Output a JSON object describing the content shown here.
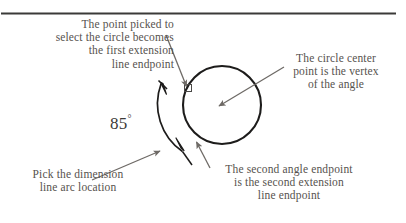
{
  "figure": {
    "type": "technical-illustration",
    "divider": {
      "present": true,
      "color": "#3b3a38"
    },
    "background_color": "#ffffff",
    "callouts": {
      "top_left": "The point picked to\nselect the circle becomes\nthe first extension\nline endpoint",
      "top_right": "The circle center\npoint is the vertex\nof the angle",
      "bottom_left": "Pick the dimension\nline arc location",
      "bottom_right": "The second angle endpoint\nis the second extension\nline endpoint"
    },
    "angle": {
      "value": "85",
      "degree_symbol": "°",
      "label": "85°"
    },
    "colors": {
      "caption_text": "#56524e",
      "angle_text": "#3c3a38",
      "geometry_stroke": "#1d1c1b",
      "leader_stroke": "#6e6a66"
    },
    "geometry": {
      "circle": {
        "cx": 222,
        "cy": 105,
        "r": 39
      },
      "dimension_arc": {
        "from": [
          160,
          85
        ],
        "to": [
          183,
          152
        ]
      },
      "pick_marker": {
        "x": 188,
        "y": 88
      }
    }
  }
}
